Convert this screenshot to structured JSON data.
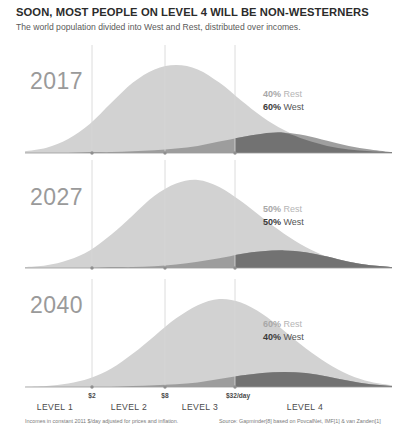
{
  "header": {
    "title": "SOON, MOST PEOPLE ON LEVEL 4 WILL BE NON-WESTERNERS",
    "subtitle": "The world population divided into West and Rest, distributed over incomes."
  },
  "footnotes": {
    "left": "Incomes in constant 2011 $/day adjusted for prices and inflation.",
    "right": "Source: Gapminder[8] based on PovcalNet, IMF[1] & van Zanden[1]"
  },
  "axis": {
    "ticks": [
      {
        "label": "$2",
        "x": 92
      },
      {
        "label": "$8",
        "x": 165
      },
      {
        "label": "$32/day",
        "x": 235
      }
    ],
    "levels": [
      {
        "label": "LEVEL 1",
        "x": 55
      },
      {
        "label": "LEVEL 2",
        "x": 129
      },
      {
        "label": "LEVEL 3",
        "x": 200
      },
      {
        "label": "LEVEL 4",
        "x": 305
      }
    ]
  },
  "colors": {
    "rest": "#d2d2d2",
    "west": "#9a9a9a",
    "overlap": "#6e6e6e",
    "gridline": "#d8d8d8",
    "baseline": "#9a9a9a",
    "title": "#2b2b2b",
    "year": "#9a9a9a"
  },
  "panels": [
    {
      "year": "2017",
      "rest_pct": "40%",
      "rest_word": "Rest",
      "west_pct": "60%",
      "west_word": "West",
      "year_x": 30,
      "year_y": 68,
      "legend_x": 263,
      "legend_y": 88,
      "baseline_y": 153
    },
    {
      "year": "2027",
      "rest_pct": "50%",
      "rest_word": "Rest",
      "west_pct": "50%",
      "west_word": "West",
      "year_x": 30,
      "year_y": 184,
      "legend_x": 263,
      "legend_y": 203,
      "baseline_y": 268
    },
    {
      "year": "2040",
      "rest_pct": "60%",
      "rest_word": "Rest",
      "west_pct": "40%",
      "west_word": "West",
      "year_x": 30,
      "year_y": 292,
      "legend_x": 263,
      "legend_y": 318,
      "baseline_y": 387
    }
  ],
  "chart_data": {
    "type": "area",
    "title": "SOON, MOST PEOPLE ON LEVEL 4 WILL BE NON-WESTERNERS",
    "subtitle": "The world population divided into West and Rest, distributed over incomes.",
    "xlabel": "Income ($/day, log scale)",
    "ylabel": "Population",
    "x_tick_values": [
      2,
      8,
      32
    ],
    "x_tick_labels": [
      "$2",
      "$8",
      "$32/day"
    ],
    "x_category_labels": [
      "LEVEL 1",
      "LEVEL 2",
      "LEVEL 3",
      "LEVEL 4"
    ],
    "grid": true,
    "legend_position": "right-inside",
    "panels": [
      {
        "name": "2017",
        "series": [
          {
            "name": "Rest",
            "share_pct": 40,
            "peak_income_usd_per_day": 5,
            "peak_height": 1.0,
            "values": [
              0.02,
              0.06,
              0.16,
              0.33,
              0.57,
              0.8,
              0.95,
              1.0,
              0.95,
              0.8,
              0.6,
              0.41,
              0.26,
              0.15,
              0.08,
              0.04,
              0.02,
              0.01
            ]
          },
          {
            "name": "West",
            "share_pct": 60,
            "peak_income_usd_per_day": 50,
            "peak_height": 0.23,
            "values": [
              0.0,
              0.0,
              0.0,
              0.01,
              0.01,
              0.02,
              0.03,
              0.05,
              0.08,
              0.13,
              0.18,
              0.22,
              0.23,
              0.2,
              0.14,
              0.08,
              0.04,
              0.01
            ]
          }
        ]
      },
      {
        "name": "2027",
        "series": [
          {
            "name": "Rest",
            "share_pct": 50,
            "peak_income_usd_per_day": 8,
            "peak_height": 1.0,
            "values": [
              0.01,
              0.03,
              0.09,
              0.2,
              0.38,
              0.6,
              0.82,
              0.96,
              1.0,
              0.92,
              0.76,
              0.57,
              0.39,
              0.24,
              0.13,
              0.07,
              0.03,
              0.01
            ]
          },
          {
            "name": "West",
            "share_pct": 50,
            "peak_income_usd_per_day": 55,
            "peak_height": 0.2,
            "values": [
              0.0,
              0.0,
              0.0,
              0.0,
              0.01,
              0.01,
              0.02,
              0.04,
              0.07,
              0.11,
              0.16,
              0.19,
              0.2,
              0.18,
              0.13,
              0.07,
              0.03,
              0.01
            ]
          }
        ]
      },
      {
        "name": "2040",
        "series": [
          {
            "name": "Rest",
            "share_pct": 60,
            "peak_income_usd_per_day": 13,
            "peak_height": 1.0,
            "values": [
              0.0,
              0.01,
              0.04,
              0.1,
              0.21,
              0.38,
              0.58,
              0.78,
              0.93,
              1.0,
              0.96,
              0.83,
              0.64,
              0.44,
              0.27,
              0.14,
              0.06,
              0.02
            ]
          },
          {
            "name": "West",
            "share_pct": 40,
            "peak_income_usd_per_day": 60,
            "peak_height": 0.17,
            "values": [
              0.0,
              0.0,
              0.0,
              0.0,
              0.0,
              0.01,
              0.02,
              0.03,
              0.05,
              0.09,
              0.13,
              0.16,
              0.17,
              0.16,
              0.12,
              0.07,
              0.03,
              0.01
            ]
          }
        ]
      }
    ]
  }
}
